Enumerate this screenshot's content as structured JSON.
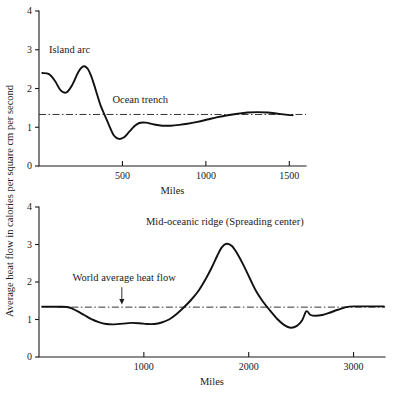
{
  "figure": {
    "shared_ylabel": "Average heat flow in calories per square cm per second",
    "background_color": "#ffffff",
    "curve_color": "#111111",
    "reference_line_color": "#333333"
  },
  "chart_data": [
    {
      "id": "island-arc-trench-profile",
      "type": "line",
      "title": "",
      "xlabel": "Miles",
      "ylabel": "Average heat flow in calories per square cm per second",
      "xlim": [
        0,
        1600
      ],
      "ylim": [
        0,
        4
      ],
      "xticks": [
        500,
        1000,
        1500
      ],
      "xtick_labels": [
        "500",
        "1000",
        "1500"
      ],
      "yticks": [
        0,
        1,
        2,
        3,
        4
      ],
      "ytick_labels": [
        "0",
        "1",
        "2",
        "3",
        "4"
      ],
      "grid": false,
      "legend": "none",
      "reference_line": {
        "name": "World average heat flow",
        "value": 1.33,
        "style": "dash-dot",
        "x_start": 0,
        "x_end": 1600
      },
      "annotations": [
        {
          "text": "Island arc",
          "x": 60,
          "y": 2.92,
          "anchor": "start"
        },
        {
          "text": "Ocean trench",
          "x": 440,
          "y": 1.62,
          "anchor": "start"
        }
      ],
      "series": [
        {
          "name": "Heat flow profile",
          "x": [
            20,
            60,
            95,
            130,
            165,
            200,
            235,
            265,
            290,
            310,
            330,
            350,
            370,
            395,
            420,
            450,
            480,
            510,
            540,
            570,
            600,
            640,
            690,
            740,
            790,
            840,
            890,
            950,
            1010,
            1070,
            1130,
            1190,
            1250,
            1310,
            1370,
            1430,
            1490,
            1520
          ],
          "y": [
            2.4,
            2.37,
            2.2,
            1.95,
            1.9,
            2.1,
            2.42,
            2.57,
            2.52,
            2.35,
            2.1,
            1.82,
            1.55,
            1.3,
            1.05,
            0.78,
            0.7,
            0.74,
            0.88,
            1.02,
            1.11,
            1.12,
            1.07,
            1.04,
            1.04,
            1.06,
            1.09,
            1.14,
            1.2,
            1.26,
            1.31,
            1.35,
            1.38,
            1.39,
            1.38,
            1.35,
            1.32,
            1.31
          ]
        }
      ]
    },
    {
      "id": "mid-oceanic-ridge-profile",
      "type": "line",
      "title": "",
      "xlabel": "Miles",
      "ylabel": "Average heat flow in calories per square cm per second",
      "xlim": [
        0,
        3300
      ],
      "ylim": [
        0,
        4
      ],
      "xticks": [
        1000,
        2000,
        3000
      ],
      "xtick_labels": [
        "1000",
        "2000",
        "3000"
      ],
      "yticks": [
        0,
        1,
        2,
        3,
        4
      ],
      "ytick_labels": [
        "0",
        "1",
        "2",
        "3",
        "4"
      ],
      "grid": false,
      "legend": "none",
      "reference_line": {
        "name": "World average heat flow",
        "value": 1.33,
        "style": "dash-dot",
        "x_start": 180,
        "x_end": 3300
      },
      "annotations": [
        {
          "text": "Mid-oceanic ridge  (Spreading center)",
          "x": 1020,
          "y": 3.52,
          "anchor": "start"
        },
        {
          "text": "World average heat flow",
          "x": 320,
          "y": 2.02,
          "anchor": "start"
        }
      ],
      "arrow": {
        "name": "world-average-pointer",
        "x": 790,
        "y_start": 1.86,
        "y_end": 1.4
      },
      "series": [
        {
          "name": "Heat flow profile",
          "x": [
            30,
            120,
            210,
            290,
            360,
            430,
            500,
            570,
            640,
            720,
            800,
            880,
            960,
            1030,
            1100,
            1170,
            1240,
            1310,
            1380,
            1450,
            1520,
            1590,
            1650,
            1700,
            1745,
            1790,
            1840,
            1890,
            1950,
            2010,
            2070,
            2130,
            2200,
            2270,
            2340,
            2400,
            2460,
            2510,
            2550,
            2590,
            2640,
            2700,
            2770,
            2850,
            2930,
            3010,
            3100,
            3200,
            3290
          ],
          "y": [
            1.34,
            1.34,
            1.34,
            1.32,
            1.23,
            1.12,
            1.01,
            0.93,
            0.88,
            0.87,
            0.89,
            0.91,
            0.9,
            0.88,
            0.88,
            0.92,
            1.0,
            1.14,
            1.32,
            1.52,
            1.76,
            2.08,
            2.4,
            2.7,
            2.93,
            3.02,
            2.96,
            2.76,
            2.45,
            2.1,
            1.76,
            1.5,
            1.25,
            1.02,
            0.85,
            0.78,
            0.83,
            0.98,
            1.22,
            1.12,
            1.1,
            1.12,
            1.18,
            1.26,
            1.33,
            1.35,
            1.35,
            1.35,
            1.35
          ]
        }
      ]
    }
  ]
}
